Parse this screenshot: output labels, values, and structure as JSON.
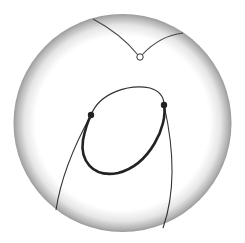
{
  "diagram": {
    "type": "disk-with-curves",
    "background": "#ffffff",
    "disk": {
      "cx": 122.5,
      "cy": 123,
      "r": 109,
      "boundary_shade_color": "#8a8a8a"
    },
    "top_curve": {
      "path": "M93,19 C110,28 126,40 138,55 M142,55 C152,44 166,35 183,33",
      "stroke": "#444444",
      "width": 1.1
    },
    "open_point": {
      "cx": 140,
      "cy": 57,
      "r": 3.2,
      "fill": "#ffffff",
      "stroke": "#333333"
    },
    "loop": {
      "cx": 126,
      "cy": 131,
      "rx": 41,
      "ry": 43,
      "rotate": 25,
      "stroke": "#222222",
      "thick_width": 2.6,
      "thin_width": 1.2
    },
    "points": [
      {
        "name": "left-point",
        "cx": 91,
        "cy": 115,
        "r": 3.2,
        "fill": "#222222"
      },
      {
        "name": "right-point",
        "cx": 164,
        "cy": 105,
        "r": 3.2,
        "fill": "#222222"
      }
    ],
    "left_line": {
      "path": "M91,115 C80,135 62,170 56,210",
      "stroke": "#333333",
      "width": 1.1
    },
    "right_line": {
      "path": "M164,105 C172,140 178,185 163,228",
      "stroke": "#333333",
      "width": 1.1
    }
  }
}
